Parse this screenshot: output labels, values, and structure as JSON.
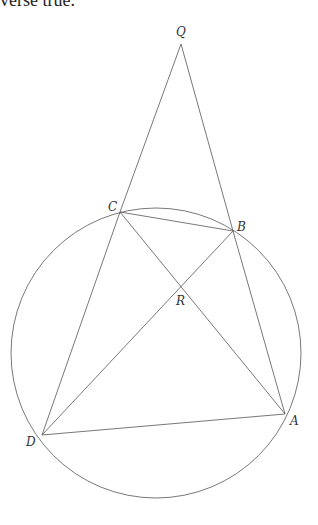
{
  "text": {
    "clipped_line": "verse true."
  },
  "figure": {
    "points": {
      "Q": "Q",
      "C": "C",
      "B": "B",
      "R": "R",
      "D": "D",
      "A": "A"
    },
    "line_color": "#555555"
  }
}
